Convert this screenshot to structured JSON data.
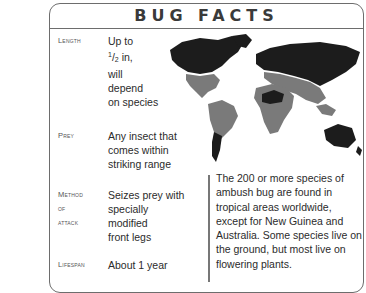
{
  "card": {
    "title": "BUG FACTS",
    "facts": [
      {
        "label": "Length",
        "label_sub": "",
        "value_lines": [
          "Up to",
          "½ in,",
          "will",
          "depend",
          "on species"
        ],
        "fraction": {
          "num": "1",
          "den": "2",
          "suffix": " in,"
        }
      },
      {
        "label": "Prey",
        "label_sub": "",
        "value_lines": [
          "Any insect that",
          "comes within",
          "striking range"
        ]
      },
      {
        "label": "Method",
        "label_sub": "of attack",
        "value_lines": [
          "Seizes prey with",
          "specially",
          "modified",
          "front legs"
        ]
      },
      {
        "label": "Lifespan",
        "label_sub": "",
        "value_lines": [
          "About 1 year"
        ]
      }
    ],
    "description": "The 200 or more species of ambush bug are found in tropical areas worldwide, except for New Guinea and Australia. Some species live on the ground, but most live on flowering plants."
  },
  "map": {
    "type": "world-distribution-map",
    "colors": {
      "range": "#7a7a7a",
      "non_range_land": "#1c1c1c",
      "background": "#ffffff"
    }
  }
}
